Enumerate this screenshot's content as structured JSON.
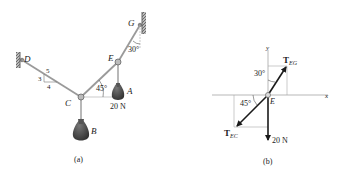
{
  "figure_a": {
    "caption": "(a)",
    "points": {
      "D": "D",
      "C": "C",
      "E": "E",
      "G": "G",
      "A": "A",
      "B": "B"
    },
    "slope": {
      "hyp": "5",
      "rise": "3",
      "run": "4"
    },
    "angle_EG": "30°",
    "angle_CE": "45°",
    "weight_A": "20 N"
  },
  "figure_b": {
    "caption": "(b)",
    "axis_x": "x",
    "axis_y": "y",
    "origin": "E",
    "force_EG": {
      "main": "T",
      "sub": "EG"
    },
    "force_EC": {
      "main": "T",
      "sub": "EC"
    },
    "force_weight": "20 N",
    "angle_EG": "30°",
    "angle_EC": "45°"
  },
  "colors": {
    "cable": "#9a9a9a",
    "arrow": "#1a1a1a",
    "weight": "#4a4a4a",
    "wall": "#777777",
    "guide": "#aaaaaa"
  }
}
